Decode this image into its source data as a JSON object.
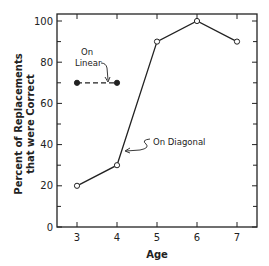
{
  "chart_data": {
    "type": "line",
    "title": "",
    "xlabel": "Age",
    "ylabel_lines": [
      "Percent of Replacements",
      "that were Correct"
    ],
    "x": [
      3,
      4,
      5,
      6,
      7
    ],
    "x_tick_labels": [
      "3",
      "4",
      "5",
      "6",
      "7"
    ],
    "y_tick_labels": [
      "0",
      "20",
      "40",
      "60",
      "80",
      "100"
    ],
    "xlim": [
      2.5,
      7.5
    ],
    "ylim": [
      0,
      100
    ],
    "grid": false,
    "series": [
      {
        "name": "On Diagonal",
        "marker": "open-circle",
        "line": "solid",
        "values": [
          20,
          30,
          90,
          100,
          90
        ]
      },
      {
        "name": "On Linear",
        "marker": "filled-circle",
        "line": "dashed",
        "x": [
          3,
          4
        ],
        "values": [
          70,
          70
        ]
      }
    ],
    "annotations": [
      {
        "text": "On",
        "target": "On Linear"
      },
      {
        "text": "Linear",
        "target": "On Linear"
      },
      {
        "text": "On Diagonal",
        "target": "On Diagonal"
      }
    ]
  }
}
